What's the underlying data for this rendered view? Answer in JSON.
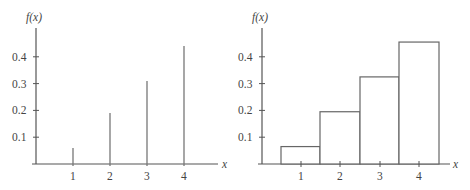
{
  "chart_data": [
    {
      "type": "stem",
      "ylabel": "f(x)",
      "xlabel": "x",
      "categories": [
        "1",
        "2",
        "3",
        "4"
      ],
      "x": [
        1,
        2,
        3,
        4
      ],
      "values": [
        0.06,
        0.19,
        0.31,
        0.44
      ],
      "yticks": [
        "0.1",
        "0.2",
        "0.3",
        "0.4"
      ],
      "xticks": [
        "1",
        "2",
        "3",
        "4"
      ],
      "ylim": [
        0,
        0.5
      ],
      "grid": false
    },
    {
      "type": "bar",
      "subtype": "histogram",
      "ylabel": "f(x)",
      "xlabel": "x",
      "categories": [
        "1",
        "2",
        "3",
        "4"
      ],
      "x": [
        1,
        2,
        3,
        4
      ],
      "values": [
        0.065,
        0.195,
        0.325,
        0.455
      ],
      "yticks": [
        "0.1",
        "0.2",
        "0.3",
        "0.4"
      ],
      "xticks": [
        "1",
        "2",
        "3",
        "4"
      ],
      "ylim": [
        0,
        0.5
      ],
      "grid": false
    }
  ]
}
